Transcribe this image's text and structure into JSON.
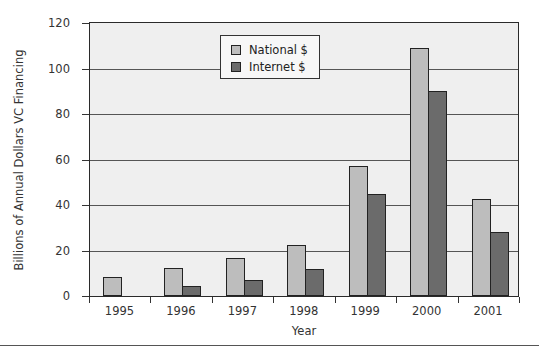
{
  "chart_data": {
    "type": "bar",
    "title": "",
    "xlabel": "Year",
    "ylabel": "Billions of Annual Dollars VC Financing",
    "categories": [
      "1995",
      "1996",
      "1997",
      "1998",
      "1999",
      "2000",
      "2001"
    ],
    "series": [
      {
        "name": "National $",
        "color": "#bdbdbd",
        "values": [
          8.5,
          12.5,
          16.5,
          22.5,
          57,
          109,
          42.5
        ]
      },
      {
        "name": "Internet $",
        "color": "#6b6b6b",
        "values": [
          0,
          4.5,
          7,
          12,
          45,
          90,
          28
        ]
      }
    ],
    "ylim": [
      0,
      120
    ],
    "yticks": [
      "0",
      "20",
      "40",
      "60",
      "80",
      "100",
      "120"
    ],
    "grid": true,
    "legend_position": "top-center-inside"
  }
}
